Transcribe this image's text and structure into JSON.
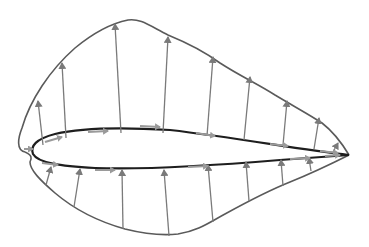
{
  "diagram": {
    "type": "airfoil-pressure-distribution",
    "colors": {
      "background": "#ffffff",
      "airfoil_outline": "#1e1e1e",
      "envelope": "#5a5a5a",
      "arrow": "#7a7a7a",
      "tangential_arrow": "#9a9a9a"
    },
    "airfoil": {
      "leading_edge": [
        32,
        150
      ],
      "trailing_edge": [
        349,
        155
      ]
    },
    "upper_arrows": [
      {
        "from": [
          43,
          145
        ],
        "to": [
          38,
          101
        ]
      },
      {
        "from": [
          66,
          138
        ],
        "to": [
          62,
          63
        ]
      },
      {
        "from": [
          121,
          133
        ],
        "to": [
          115,
          24
        ]
      },
      {
        "from": [
          163,
          133
        ],
        "to": [
          168,
          37
        ]
      },
      {
        "from": [
          207,
          136
        ],
        "to": [
          213,
          57
        ]
      },
      {
        "from": [
          244,
          140
        ],
        "to": [
          250,
          77
        ]
      },
      {
        "from": [
          283,
          145
        ],
        "to": [
          287,
          101
        ]
      },
      {
        "from": [
          314,
          149
        ],
        "to": [
          319,
          118
        ]
      },
      {
        "from": [
          333,
          152
        ],
        "to": [
          338,
          143
        ]
      }
    ],
    "lower_arrows": [
      {
        "from": [
          46,
          185
        ],
        "to": [
          51,
          167
        ]
      },
      {
        "from": [
          74,
          207
        ],
        "to": [
          80,
          169
        ]
      },
      {
        "from": [
          123,
          229
        ],
        "to": [
          122,
          170
        ]
      },
      {
        "from": [
          169,
          236
        ],
        "to": [
          164,
          170
        ]
      },
      {
        "from": [
          213,
          222
        ],
        "to": [
          208,
          165
        ]
      },
      {
        "from": [
          249,
          201
        ],
        "to": [
          246,
          162
        ]
      },
      {
        "from": [
          283,
          186
        ],
        "to": [
          281,
          160
        ]
      },
      {
        "from": [
          311,
          171
        ],
        "to": [
          309,
          158
        ]
      }
    ],
    "tangential_arrows": [
      {
        "from": [
          24,
          149
        ],
        "to": [
          33,
          149
        ]
      },
      {
        "from": [
          45,
          142
        ],
        "to": [
          62,
          137
        ]
      },
      {
        "from": [
          88,
          132
        ],
        "to": [
          108,
          131
        ]
      },
      {
        "from": [
          140,
          126
        ],
        "to": [
          160,
          127
        ]
      },
      {
        "from": [
          196,
          133
        ],
        "to": [
          215,
          136
        ]
      },
      {
        "from": [
          270,
          144
        ],
        "to": [
          288,
          146
        ]
      },
      {
        "from": [
          320,
          151
        ],
        "to": [
          338,
          153
        ]
      },
      {
        "from": [
          42,
          163
        ],
        "to": [
          58,
          165
        ]
      },
      {
        "from": [
          95,
          170
        ],
        "to": [
          115,
          170
        ]
      },
      {
        "from": [
          188,
          167
        ],
        "to": [
          208,
          166
        ]
      },
      {
        "from": [
          290,
          159
        ],
        "to": [
          310,
          158
        ]
      },
      {
        "from": [
          325,
          156
        ],
        "to": [
          340,
          155
        ]
      }
    ]
  }
}
